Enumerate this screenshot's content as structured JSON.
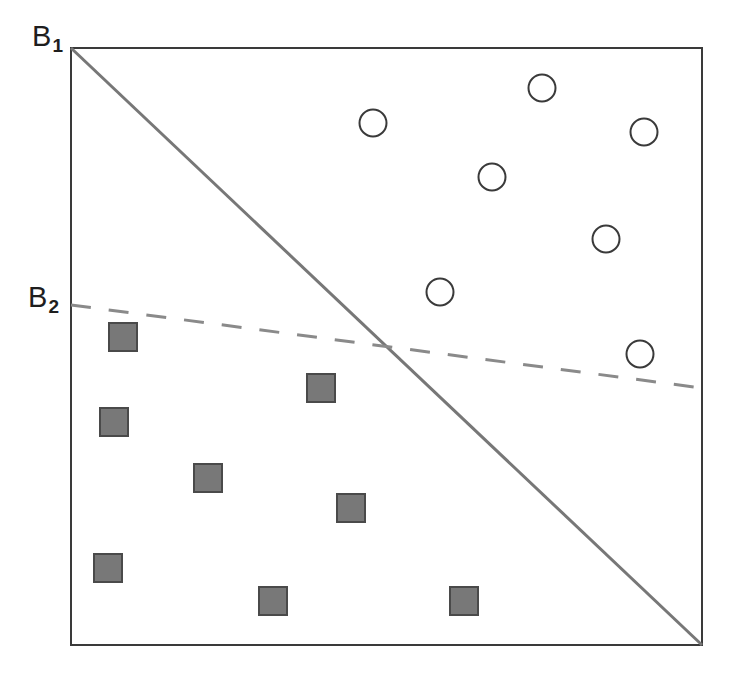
{
  "figure": {
    "title": "",
    "background_color": "#ffffff",
    "frame": {
      "left": 71,
      "top": 48,
      "right": 702,
      "bottom": 645,
      "border_color": "#3a3a3a",
      "border_width": 2
    }
  },
  "labels": {
    "b1": {
      "base": "B",
      "subscript": "1"
    },
    "b2": {
      "base": "B",
      "subscript": "2"
    }
  },
  "chart_data": {
    "type": "scatter",
    "title": "",
    "xlabel": "",
    "ylabel": "",
    "xlim": [
      0,
      100
    ],
    "ylim": [
      0,
      100
    ],
    "grid": false,
    "legend": "none",
    "axis_ticks": false,
    "series": [
      {
        "name": "circles",
        "marker": "open-circle",
        "marker_size_px": 27,
        "fill_color": "#ffffff",
        "edge_color": "#3a3a3a",
        "edge_width_px": 2,
        "count": 7,
        "points_px": [
          {
            "cx": 373,
            "cy": 123
          },
          {
            "cx": 542,
            "cy": 88
          },
          {
            "cx": 644,
            "cy": 132
          },
          {
            "cx": 492,
            "cy": 177
          },
          {
            "cx": 606,
            "cy": 239
          },
          {
            "cx": 440,
            "cy": 292
          },
          {
            "cx": 640,
            "cy": 354
          }
        ],
        "points_data": [
          {
            "x": 47.9,
            "y": 87.4
          },
          {
            "x": 74.6,
            "y": 93.3
          },
          {
            "x": 90.8,
            "y": 85.9
          },
          {
            "x": 66.7,
            "y": 78.4
          },
          {
            "x": 84.8,
            "y": 68.0
          },
          {
            "x": 58.5,
            "y": 59.1
          },
          {
            "x": 90.2,
            "y": 48.7
          }
        ]
      },
      {
        "name": "squares",
        "marker": "filled-square",
        "marker_size_px": 28,
        "fill_color": "#787878",
        "edge_color": "#4a4a4a",
        "edge_width_px": 2,
        "count": 8,
        "points_px": [
          {
            "cx": 123,
            "cy": 337
          },
          {
            "cx": 321,
            "cy": 388
          },
          {
            "cx": 114,
            "cy": 422
          },
          {
            "cx": 208,
            "cy": 478
          },
          {
            "cx": 351,
            "cy": 508
          },
          {
            "cx": 108,
            "cy": 568
          },
          {
            "cx": 273,
            "cy": 601
          },
          {
            "cx": 464,
            "cy": 601
          }
        ],
        "points_data": [
          {
            "x": 8.2,
            "y": 51.6
          },
          {
            "x": 39.6,
            "y": 43.0
          },
          {
            "x": 6.8,
            "y": 37.4
          },
          {
            "x": 21.7,
            "y": 28.0
          },
          {
            "x": 44.4,
            "y": 22.9
          },
          {
            "x": 5.9,
            "y": 12.9
          },
          {
            "x": 32.0,
            "y": 7.4
          },
          {
            "x": 62.3,
            "y": 7.4
          }
        ]
      }
    ],
    "boundaries": [
      {
        "name": "B1",
        "label": "B",
        "label_subscript": "1",
        "style": "solid",
        "color": "#777777",
        "width_px": 3,
        "from_px": {
          "x": 71,
          "y": 48
        },
        "to_px": {
          "x": 702,
          "y": 645
        },
        "from_data": {
          "x": 0,
          "y": 100
        },
        "to_data": {
          "x": 100,
          "y": 0
        }
      },
      {
        "name": "B2",
        "label": "B",
        "label_subscript": "2",
        "style": "dashed",
        "dash_pattern_px": [
          20,
          18
        ],
        "color": "#8a8a8a",
        "width_px": 3,
        "from_px": {
          "x": 71,
          "y": 305
        },
        "to_px": {
          "x": 702,
          "y": 388
        },
        "from_data": {
          "x": 0,
          "y": 57.0
        },
        "to_data": {
          "x": 100,
          "y": 43.0
        }
      }
    ],
    "annotations": [
      {
        "text": "B1",
        "x_px": 38,
        "y_px": 36,
        "anchor": "left-of-axis"
      },
      {
        "text": "B2",
        "x_px": 34,
        "y_px": 297,
        "anchor": "left-of-axis"
      }
    ]
  }
}
